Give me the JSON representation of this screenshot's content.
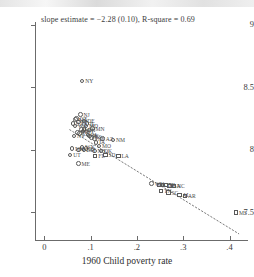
{
  "chart_data": {
    "type": "scatter",
    "title": "",
    "annotation": "slope estimate = −2.28 (0.10), R-square = 0.69",
    "xlabel": "1960 Child poverty rate",
    "ylabel": "",
    "xlim": [
      -0.02,
      0.44
    ],
    "ylim": [
      7.28,
      9.02
    ],
    "xticks": [
      0,
      0.1,
      0.2,
      0.3,
      0.4
    ],
    "xtick_labels": [
      "0",
      ".1",
      ".2",
      ".3",
      ".4"
    ],
    "yticks": [
      7.5,
      8,
      8.5,
      9
    ],
    "ytick_labels": [
      "7.5",
      "8",
      "8.5",
      "9"
    ],
    "grid": false,
    "legend": "none",
    "slope": -2.28,
    "slope_se": 0.1,
    "r_square": 0.69,
    "regression_line": {
      "style": "dotted",
      "x0": 0.055,
      "y0": 8.16,
      "x1": 0.42,
      "y1": 7.33
    },
    "marker_shapes": {
      "circle": "non-southern state",
      "square": "southern state"
    },
    "points": [
      {
        "label": "NY",
        "x": 0.082,
        "y": 8.55,
        "shape": "circle"
      },
      {
        "label": "NJ",
        "x": 0.078,
        "y": 8.28,
        "shape": "circle"
      },
      {
        "label": "CT",
        "x": 0.07,
        "y": 8.25,
        "shape": "circle"
      },
      {
        "label": "MA",
        "x": 0.068,
        "y": 8.24,
        "shape": "circle"
      },
      {
        "label": "RI",
        "x": 0.074,
        "y": 8.22,
        "shape": "circle"
      },
      {
        "label": "DE",
        "x": 0.086,
        "y": 8.23,
        "shape": "circle"
      },
      {
        "label": "IL",
        "x": 0.092,
        "y": 8.21,
        "shape": "circle"
      },
      {
        "label": "CA",
        "x": 0.062,
        "y": 8.21,
        "shape": "circle"
      },
      {
        "label": "WA",
        "x": 0.066,
        "y": 8.19,
        "shape": "circle"
      },
      {
        "label": "MD",
        "x": 0.09,
        "y": 8.19,
        "shape": "circle"
      },
      {
        "label": "MN",
        "x": 0.104,
        "y": 8.17,
        "shape": "circle"
      },
      {
        "label": "OH",
        "x": 0.086,
        "y": 8.16,
        "shape": "circle"
      },
      {
        "label": "MI",
        "x": 0.08,
        "y": 8.16,
        "shape": "circle"
      },
      {
        "label": "WI",
        "x": 0.084,
        "y": 8.15,
        "shape": "circle"
      },
      {
        "label": "OR",
        "x": 0.072,
        "y": 8.14,
        "shape": "circle"
      },
      {
        "label": "CO",
        "x": 0.076,
        "y": 8.13,
        "shape": "circle"
      },
      {
        "label": "PA",
        "x": 0.094,
        "y": 8.12,
        "shape": "circle"
      },
      {
        "label": "IN",
        "x": 0.098,
        "y": 8.11,
        "shape": "circle"
      },
      {
        "label": "NV",
        "x": 0.064,
        "y": 8.11,
        "shape": "circle"
      },
      {
        "label": "KS",
        "x": 0.102,
        "y": 8.1,
        "shape": "circle"
      },
      {
        "label": "NE",
        "x": 0.108,
        "y": 8.09,
        "shape": "circle"
      },
      {
        "label": "AZ",
        "x": 0.126,
        "y": 8.09,
        "shape": "circle"
      },
      {
        "label": "NM",
        "x": 0.148,
        "y": 8.08,
        "shape": "circle"
      },
      {
        "label": "IA",
        "x": 0.112,
        "y": 8.06,
        "shape": "circle"
      },
      {
        "label": "MO",
        "x": 0.118,
        "y": 8.03,
        "shape": "circle"
      },
      {
        "label": "WY",
        "x": 0.082,
        "y": 8.02,
        "shape": "circle"
      },
      {
        "label": "ID",
        "x": 0.09,
        "y": 8.01,
        "shape": "circle"
      },
      {
        "label": "MT",
        "x": 0.086,
        "y": 8.0,
        "shape": "circle"
      },
      {
        "label": "NH",
        "x": 0.06,
        "y": 8.01,
        "shape": "circle"
      },
      {
        "label": "VT",
        "x": 0.074,
        "y": 8.0,
        "shape": "circle"
      },
      {
        "label": "ND",
        "x": 0.108,
        "y": 7.99,
        "shape": "circle"
      },
      {
        "label": "OK",
        "x": 0.122,
        "y": 7.99,
        "shape": "circle"
      },
      {
        "label": "SD",
        "x": 0.132,
        "y": 7.96,
        "shape": "square"
      },
      {
        "label": "FL",
        "x": 0.11,
        "y": 7.95,
        "shape": "square"
      },
      {
        "label": "UT",
        "x": 0.056,
        "y": 7.96,
        "shape": "circle"
      },
      {
        "label": "LA",
        "x": 0.16,
        "y": 7.95,
        "shape": "square"
      },
      {
        "label": "ME",
        "x": 0.074,
        "y": 7.89,
        "shape": "circle"
      },
      {
        "label": "WV",
        "x": 0.232,
        "y": 7.73,
        "shape": "circle"
      },
      {
        "label": "KY",
        "x": 0.248,
        "y": 7.72,
        "shape": "square"
      },
      {
        "label": "TX",
        "x": 0.256,
        "y": 7.72,
        "shape": "square"
      },
      {
        "label": "VA",
        "x": 0.262,
        "y": 7.72,
        "shape": "square"
      },
      {
        "label": "GA",
        "x": 0.27,
        "y": 7.71,
        "shape": "square"
      },
      {
        "label": "NC",
        "x": 0.28,
        "y": 7.71,
        "shape": "square"
      },
      {
        "label": "TN",
        "x": 0.252,
        "y": 7.67,
        "shape": "square"
      },
      {
        "label": "SC",
        "x": 0.268,
        "y": 7.66,
        "shape": "square"
      },
      {
        "label": "AL",
        "x": 0.292,
        "y": 7.64,
        "shape": "square"
      },
      {
        "label": "AR",
        "x": 0.304,
        "y": 7.63,
        "shape": "square"
      },
      {
        "label": "MS",
        "x": 0.414,
        "y": 7.5,
        "shape": "square"
      }
    ]
  }
}
